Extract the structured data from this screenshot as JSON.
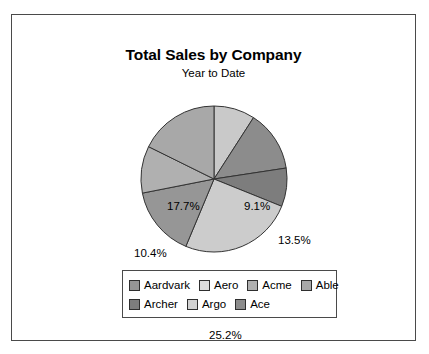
{
  "chart_data": {
    "type": "pie",
    "title": "Total Sales by Company",
    "subtitle": "Year to Date",
    "xlabel": "",
    "ylabel": "",
    "legend_position": "bottom",
    "grid": false,
    "start_angle_deg": 0,
    "direction": "clockwise",
    "categories": [
      "Aardvark",
      "Aero",
      "Acme",
      "Able",
      "Archer",
      "Argo",
      "Ace"
    ],
    "slice_order_clockwise_from_top": [
      "Aardvark",
      "Aero",
      "Acme",
      "Able",
      "Archer",
      "Argo",
      "Ace"
    ],
    "values": [
      9.1,
      13.5,
      8.5,
      25.2,
      15.6,
      10.4,
      17.7
    ],
    "value_labels": [
      "9.1%",
      "13.5%",
      "8.5%",
      "25.2%",
      "15.6%",
      "10.4%",
      "17.7%"
    ],
    "unit": "%",
    "total": 100.0,
    "slices": [
      {
        "label": "Aardvark",
        "value": 9.1,
        "value_label": "9.1%",
        "color": "#c9c9c9"
      },
      {
        "label": "Aero",
        "value": 13.5,
        "value_label": "13.5%",
        "color": "#8c8c8c"
      },
      {
        "label": "Acme",
        "value": 8.5,
        "value_label": "8.5%",
        "color": "#7d7d7d"
      },
      {
        "label": "Able",
        "value": 25.2,
        "value_label": "25.2%",
        "color": "#cccccc"
      },
      {
        "label": "Archer",
        "value": 15.6,
        "value_label": "15.6%",
        "color": "#969696"
      },
      {
        "label": "Argo",
        "value": 10.4,
        "value_label": "10.4%",
        "color": "#b0b0b0"
      },
      {
        "label": "Ace",
        "value": 17.7,
        "value_label": "17.7%",
        "color": "#a8a8a8"
      }
    ]
  },
  "legend": {
    "rows": [
      [
        {
          "label": "Aardvark",
          "color": "#969696"
        },
        {
          "label": "Aero",
          "color": "#dcdcdc"
        },
        {
          "label": "Acme",
          "color": "#b0b0b0"
        },
        {
          "label": "Able",
          "color": "#a8a8a8"
        }
      ],
      [
        {
          "label": "Archer",
          "color": "#7d7d7d"
        },
        {
          "label": "Argo",
          "color": "#d2d2d2"
        },
        {
          "label": "Ace",
          "color": "#8c8c8c"
        }
      ]
    ]
  },
  "style": {
    "slice_outline": "#333333",
    "frame_border": "#4a4a4a",
    "background": "#ffffff"
  }
}
